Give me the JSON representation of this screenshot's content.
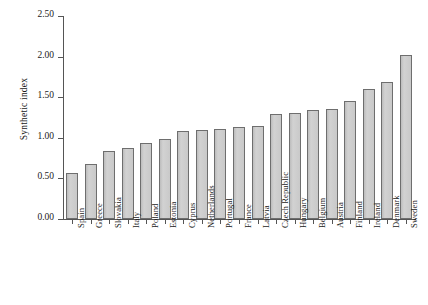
{
  "chart_data": {
    "type": "bar",
    "title": "",
    "xlabel": "",
    "ylabel": "Synthetic index",
    "ylim": [
      0.0,
      2.5
    ],
    "yticks": [
      "0.00",
      "0.50",
      "1.00",
      "1.50",
      "2.00",
      "2.50"
    ],
    "ytick_values": [
      0.0,
      0.5,
      1.0,
      1.5,
      2.0,
      2.5
    ],
    "grid": false,
    "legend": null,
    "categories": [
      "Spain",
      "Greece",
      "Slovakia",
      "Italy",
      "Poland",
      "Estonia",
      "Cyprus",
      "Netherlands",
      "Portugal",
      "France",
      "Latvia",
      "Czech Republic",
      "Hungary",
      "Belgium",
      "Austria",
      "Finland",
      "Ireland",
      "Denmark",
      "Sweden"
    ],
    "values": [
      0.57,
      0.68,
      0.84,
      0.87,
      0.93,
      0.99,
      1.08,
      1.1,
      1.11,
      1.13,
      1.15,
      1.29,
      1.31,
      1.34,
      1.35,
      1.45,
      1.6,
      1.69,
      2.02
    ],
    "bar_color": "#c9c9c9",
    "bar_edge_color": "#6e6e6e",
    "axis_color": "#555555",
    "background_color": "#ffffff"
  }
}
